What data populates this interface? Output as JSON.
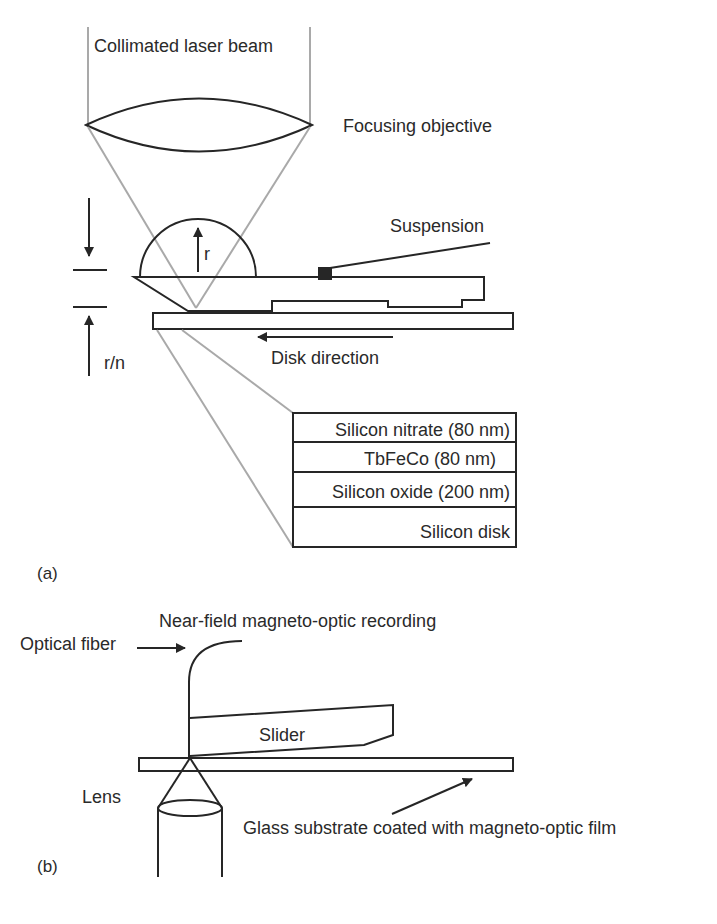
{
  "figure_a": {
    "panel_label": "(a)",
    "labels": {
      "beam": "Collimated laser beam",
      "objective": "Focusing objective",
      "suspension": "Suspension",
      "radius": "r",
      "gap": "r/n",
      "disk_direction": "Disk direction"
    },
    "layers": [
      {
        "name": "Silicon nitrate (80 nm)"
      },
      {
        "name": "TbFeCo (80 nm)"
      },
      {
        "name": "Silicon oxide (200 nm)"
      },
      {
        "name": "Silicon disk"
      }
    ]
  },
  "figure_b": {
    "panel_label": "(b)",
    "labels": {
      "title": "Near-field magneto-optic recording",
      "fiber": "Optical fiber",
      "slider": "Slider",
      "lens": "Lens",
      "substrate": "Glass substrate coated with magneto-optic film"
    }
  },
  "colors": {
    "line": "#262626",
    "beam": "#a9a9a9",
    "background": "#ffffff"
  }
}
